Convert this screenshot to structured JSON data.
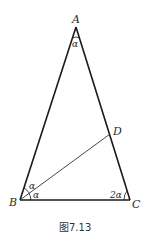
{
  "figure": {
    "caption": "图7.13",
    "vertices": {
      "A": {
        "label": "A",
        "x": 76,
        "y": 27
      },
      "B": {
        "label": "B",
        "x": 20,
        "y": 200
      },
      "C": {
        "label": "C",
        "x": 130,
        "y": 200
      },
      "D": {
        "label": "D",
        "x": 110,
        "y": 134
      }
    },
    "angle_labels": {
      "A": "α",
      "B_upper": "α",
      "B_lower": "α",
      "C": "2α"
    },
    "segments": [
      "AB",
      "AC",
      "BC",
      "BD"
    ],
    "colors": {
      "stroke": "#1a1a1a",
      "text": "#2a2a2a"
    }
  }
}
